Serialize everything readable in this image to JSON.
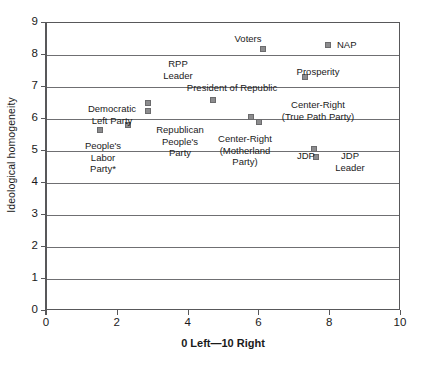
{
  "chart_data": {
    "type": "scatter",
    "title": "",
    "xlabel": "0 Left—10 Right",
    "ylabel": "Ideological homogeneity",
    "xlim": [
      0,
      10
    ],
    "ylim": [
      0,
      9
    ],
    "xticks": [
      "0",
      "2",
      "4",
      "6",
      "8",
      "10"
    ],
    "yticks": [
      "0",
      "1",
      "2",
      "3",
      "4",
      "5",
      "6",
      "7",
      "8",
      "9"
    ],
    "grid": "horizontal",
    "legend": "none",
    "marker_color": "#8c8c8e",
    "points": [
      {
        "label": "People's Labor Party*",
        "x": 1.5,
        "y": 5.65
      },
      {
        "label": "Democratic Left Party",
        "x": 2.3,
        "y": 5.8
      },
      {
        "label": "RPP Leader",
        "x": 2.85,
        "y": 6.5
      },
      {
        "label": "Republican People's Party",
        "x": 2.85,
        "y": 6.25
      },
      {
        "label": "President of Republic",
        "x": 4.7,
        "y": 6.6
      },
      {
        "label": "Voters",
        "x": 6.1,
        "y": 8.2
      },
      {
        "label": "Center-Right (True Path Party)",
        "x": 6.0,
        "y": 5.9
      },
      {
        "label": "Center-Right (Motherland Party)",
        "x": 5.75,
        "y": 6.05
      },
      {
        "label": "Prosperity",
        "x": 7.3,
        "y": 7.3
      },
      {
        "label": "NAP",
        "x": 7.95,
        "y": 8.3
      },
      {
        "label": "JDP",
        "x": 7.55,
        "y": 5.05
      },
      {
        "label": "JDP Leader",
        "x": 7.6,
        "y": 4.8
      }
    ],
    "annotations": [
      {
        "name": "peoples-labor-party",
        "lines": [
          "People's",
          "Labor",
          "Party*"
        ]
      },
      {
        "name": "democratic-left-party",
        "lines": [
          "Democratic",
          "Left Party"
        ]
      },
      {
        "name": "rpp-leader",
        "lines": [
          "RPP",
          "Leader"
        ]
      },
      {
        "name": "republican-peoples-party",
        "lines": [
          "Republican",
          "People's",
          "Party"
        ]
      },
      {
        "name": "president-of-republic",
        "lines": [
          "President of Republic"
        ]
      },
      {
        "name": "voters",
        "lines": [
          "Voters"
        ]
      },
      {
        "name": "center-right-true-path",
        "lines": [
          "Center-Right",
          "(True Path Party)"
        ]
      },
      {
        "name": "center-right-motherland",
        "lines": [
          "Center-Right",
          "(Motherland",
          "Party)"
        ]
      },
      {
        "name": "prosperity",
        "lines": [
          "Prosperity"
        ]
      },
      {
        "name": "nap",
        "lines": [
          "NAP"
        ]
      },
      {
        "name": "jdp",
        "lines": [
          "JDP"
        ]
      },
      {
        "name": "jdp-leader",
        "lines": [
          "JDP",
          "Leader"
        ]
      }
    ]
  },
  "labels": {
    "peoples_labor_party_l1": "People's",
    "peoples_labor_party_l2": "Labor",
    "peoples_labor_party_l3": "Party*",
    "democratic_left_party_l1": "Democratic",
    "democratic_left_party_l2": "Left Party",
    "rpp_leader_l1": "RPP",
    "rpp_leader_l2": "Leader",
    "republican_peoples_party_l1": "Republican",
    "republican_peoples_party_l2": "People's",
    "republican_peoples_party_l3": "Party",
    "president_of_republic": "President of Republic",
    "voters": "Voters",
    "center_right_true_path_l1": "Center-Right",
    "center_right_true_path_l2": "(True Path Party)",
    "center_right_motherland_l1": "Center-Right",
    "center_right_motherland_l2": "(Motherland",
    "center_right_motherland_l3": "Party)",
    "prosperity": "Prosperity",
    "nap": "NAP",
    "jdp": "JDP",
    "jdp_leader_l1": "JDP",
    "jdp_leader_l2": "Leader"
  }
}
